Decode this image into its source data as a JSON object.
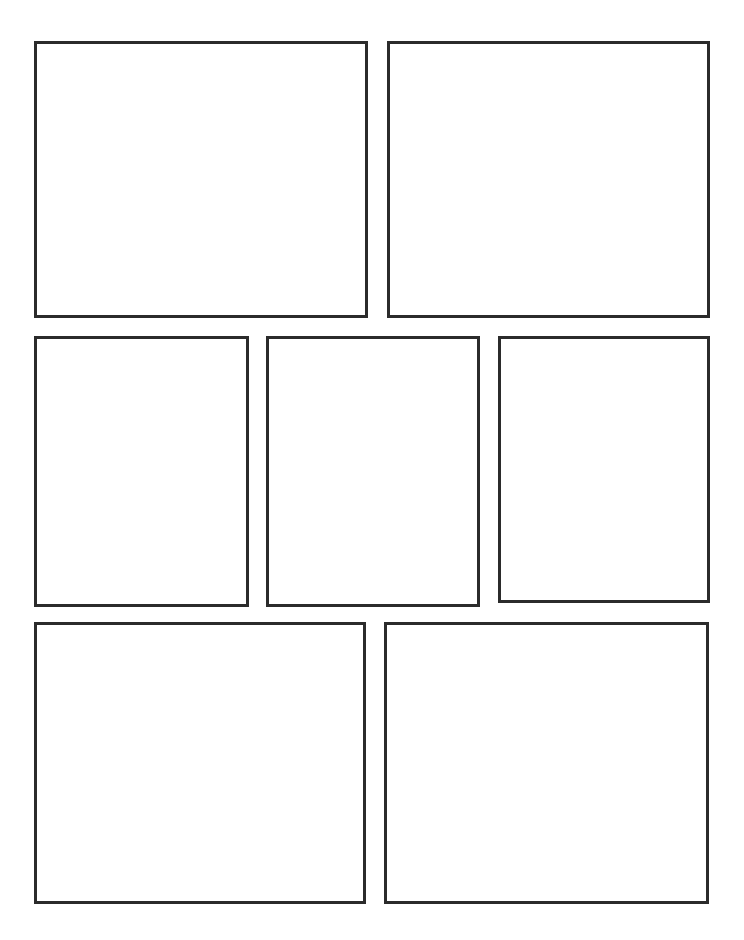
{
  "page": {
    "background_color": "#ffffff",
    "width": 744,
    "height": 940,
    "panel_count": 7,
    "row_count": 3
  },
  "style": {
    "panel_border_color": "#2b2b2b",
    "panel_border_width_px": 3,
    "panel_fill_color": "#ffffff"
  },
  "panels": [
    {
      "id": "panel-1",
      "label": "1",
      "row": 1,
      "column": 1,
      "x": 34,
      "y": 41,
      "width": 334,
      "height": 277,
      "content": ""
    },
    {
      "id": "panel-2",
      "label": "2",
      "row": 1,
      "column": 2,
      "x": 387,
      "y": 41,
      "width": 323,
      "height": 277,
      "content": ""
    },
    {
      "id": "panel-3",
      "label": "3",
      "row": 2,
      "column": 1,
      "x": 34,
      "y": 336,
      "width": 215,
      "height": 271,
      "content": ""
    },
    {
      "id": "panel-4",
      "label": "4",
      "row": 2,
      "column": 2,
      "x": 266,
      "y": 336,
      "width": 214,
      "height": 271,
      "content": ""
    },
    {
      "id": "panel-5",
      "label": "5",
      "row": 2,
      "column": 3,
      "x": 498,
      "y": 336,
      "width": 212,
      "height": 267,
      "content": ""
    },
    {
      "id": "panel-6",
      "label": "6",
      "row": 3,
      "column": 1,
      "x": 34,
      "y": 622,
      "width": 332,
      "height": 282,
      "content": ""
    },
    {
      "id": "panel-7",
      "label": "7",
      "row": 3,
      "column": 2,
      "x": 384,
      "y": 622,
      "width": 325,
      "height": 282,
      "content": ""
    }
  ]
}
